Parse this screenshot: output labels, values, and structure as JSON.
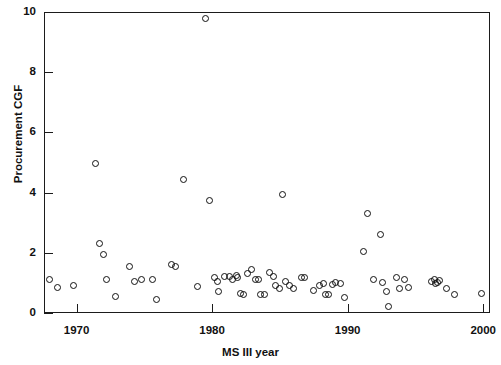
{
  "chart_data": {
    "type": "scatter",
    "title": "",
    "xlabel": "MS III year",
    "ylabel": "Procurement CGF",
    "xlim": [
      1967.6,
      2000.5
    ],
    "ylim": [
      0,
      10
    ],
    "xticks": [
      1970,
      1980,
      1990,
      2000
    ],
    "xtick_labels": [
      "1970",
      "1980",
      "1990",
      "2000"
    ],
    "yticks": [
      0,
      2,
      4,
      6,
      8,
      10
    ],
    "ytick_labels": [
      "0",
      "2",
      "4",
      "6",
      "8",
      "10"
    ],
    "grid": false,
    "legend": null,
    "marker": "open-circle",
    "marker_color": "#111111",
    "points": [
      [
        1968.0,
        1.1
      ],
      [
        1968.6,
        0.85
      ],
      [
        1969.8,
        0.9
      ],
      [
        1971.4,
        4.97
      ],
      [
        1971.7,
        2.3
      ],
      [
        1972.0,
        1.95
      ],
      [
        1972.2,
        1.12
      ],
      [
        1972.9,
        0.55
      ],
      [
        1973.9,
        1.55
      ],
      [
        1974.3,
        1.05
      ],
      [
        1974.8,
        1.1
      ],
      [
        1975.6,
        1.1
      ],
      [
        1975.9,
        0.45
      ],
      [
        1977.0,
        1.62
      ],
      [
        1977.3,
        1.55
      ],
      [
        1977.9,
        4.45
      ],
      [
        1978.9,
        0.88
      ],
      [
        1979.5,
        9.8
      ],
      [
        1979.8,
        3.73
      ],
      [
        1980.2,
        1.18
      ],
      [
        1980.4,
        1.05
      ],
      [
        1980.5,
        0.72
      ],
      [
        1980.9,
        1.22
      ],
      [
        1981.3,
        1.2
      ],
      [
        1981.5,
        1.12
      ],
      [
        1981.8,
        1.25
      ],
      [
        1981.9,
        1.18
      ],
      [
        1982.1,
        0.65
      ],
      [
        1982.3,
        0.63
      ],
      [
        1982.6,
        1.3
      ],
      [
        1982.9,
        1.45
      ],
      [
        1983.2,
        1.12
      ],
      [
        1983.4,
        1.1
      ],
      [
        1983.6,
        0.62
      ],
      [
        1983.9,
        0.6
      ],
      [
        1984.2,
        1.35
      ],
      [
        1984.5,
        1.2
      ],
      [
        1984.7,
        0.9
      ],
      [
        1985.0,
        0.8
      ],
      [
        1985.2,
        3.95
      ],
      [
        1985.4,
        1.05
      ],
      [
        1985.7,
        0.92
      ],
      [
        1986.0,
        0.82
      ],
      [
        1986.6,
        1.18
      ],
      [
        1986.8,
        1.18
      ],
      [
        1987.5,
        0.75
      ],
      [
        1987.9,
        0.92
      ],
      [
        1988.2,
        0.98
      ],
      [
        1988.4,
        0.6
      ],
      [
        1988.6,
        0.62
      ],
      [
        1988.9,
        0.95
      ],
      [
        1989.1,
        1.0
      ],
      [
        1989.5,
        0.98
      ],
      [
        1989.8,
        0.52
      ],
      [
        1991.2,
        2.05
      ],
      [
        1991.5,
        3.32
      ],
      [
        1991.9,
        1.1
      ],
      [
        1992.4,
        2.6
      ],
      [
        1992.6,
        1.0
      ],
      [
        1992.9,
        0.72
      ],
      [
        1993.0,
        0.22
      ],
      [
        1993.6,
        1.18
      ],
      [
        1993.8,
        0.8
      ],
      [
        1994.2,
        1.12
      ],
      [
        1994.5,
        0.85
      ],
      [
        1996.2,
        1.05
      ],
      [
        1996.4,
        1.1
      ],
      [
        1996.5,
        0.98
      ],
      [
        1996.6,
        1.02
      ],
      [
        1996.8,
        1.08
      ],
      [
        1997.3,
        0.8
      ],
      [
        1997.9,
        0.62
      ],
      [
        1999.9,
        0.65
      ]
    ]
  }
}
